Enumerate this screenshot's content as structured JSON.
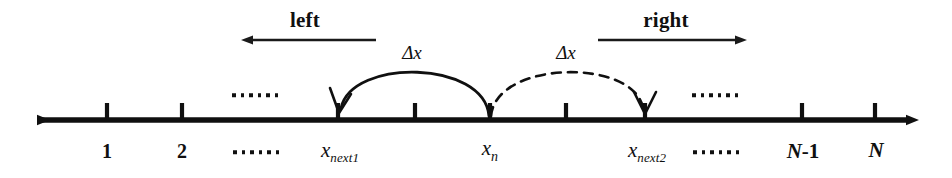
{
  "figure": {
    "stroke_color": "#101010",
    "background_color": "#ffffff"
  },
  "direction_arrows": [
    {
      "label": "left",
      "points": "left",
      "label_x": 305,
      "label_y": 20,
      "line_y": 40,
      "x_start": 375,
      "x_end": 240
    },
    {
      "label": "right",
      "points": "right",
      "label_x": 666,
      "label_y": 20,
      "line_y": 40,
      "x_start": 598,
      "x_end": 748
    }
  ],
  "axis": {
    "y": 120,
    "x_left_end": 30,
    "x_right_end": 915,
    "double_headed": true
  },
  "ticks": [
    {
      "name": "tick-1",
      "x": 107,
      "label": "1",
      "label_kind": "index"
    },
    {
      "name": "tick-2",
      "x": 182,
      "label": "2",
      "label_kind": "index"
    },
    {
      "name": "tick-next1",
      "x": 338,
      "label": "x",
      "label_kind": "math",
      "subscript": "next1"
    },
    {
      "name": "tick-mid-left",
      "x": 415,
      "label": "",
      "label_kind": "none"
    },
    {
      "name": "tick-n",
      "x": 490,
      "label": "x",
      "label_kind": "math",
      "subscript": "n"
    },
    {
      "name": "tick-mid-right",
      "x": 566,
      "label": "",
      "label_kind": "none"
    },
    {
      "name": "tick-next2",
      "x": 645,
      "label": "x",
      "label_kind": "math",
      "subscript": "next2"
    },
    {
      "name": "tick-n-minus-1",
      "x": 802,
      "label": "N-1",
      "label_kind": "bigN"
    },
    {
      "name": "tick-N",
      "x": 875,
      "label": "N",
      "label_kind": "bigN"
    }
  ],
  "ellipses": [
    {
      "name": "ellipsis-above-left",
      "x": 255,
      "y": 95,
      "count": 6,
      "size": "small"
    },
    {
      "name": "ellipsis-above-right",
      "x": 715,
      "y": 95,
      "count": 6,
      "size": "small"
    },
    {
      "name": "ellipsis-below-left",
      "x": 256,
      "y": 152,
      "count": 6,
      "size": "small"
    },
    {
      "name": "ellipsis-below-right",
      "x": 716,
      "y": 152,
      "count": 6,
      "size": "small"
    }
  ],
  "arcs": [
    {
      "name": "arc-left-move",
      "style": "solid",
      "from_x": 490,
      "to_x": 338,
      "apex_y": 66,
      "label": "Δx",
      "label_x": 412,
      "label_y": 52,
      "arrowhead_at": "to"
    },
    {
      "name": "arc-right-move",
      "style": "dashed",
      "from_x": 490,
      "to_x": 645,
      "apex_y": 66,
      "label": "Δx",
      "label_x": 566,
      "label_y": 52,
      "arrowhead_at": "to"
    }
  ],
  "labels": {
    "x_next1": {
      "base": "x",
      "sub": "next1"
    },
    "x_n": {
      "base": "x",
      "sub": "n"
    },
    "x_next2": {
      "base": "x",
      "sub": "next2"
    },
    "n_minus_1_italic": "N",
    "n_minus_1_plain": "-1",
    "N": "N",
    "one": "1",
    "two": "2",
    "delta_x_left": "Δx",
    "delta_x_right": "Δx",
    "left": "left",
    "right": "right"
  }
}
